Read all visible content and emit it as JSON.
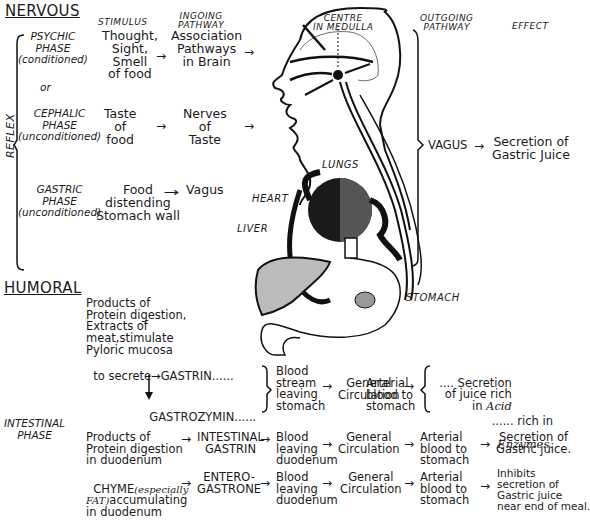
{
  "nervous": {
    "section_title": "NERVOUS",
    "reflex_label": "REFLEX",
    "headers": {
      "stimulus": "STIMULUS",
      "ingoing": "INGOING\nPATHWAY",
      "centre": "CENTRE\nIN MEDULLA",
      "outgoing": "OUTGOING\nPATHWAY",
      "effect": "EFFECT"
    },
    "phases": [
      {
        "name": "PSYCHIC\nPHASE\n(conditioned)",
        "stimulus": "Thought,\nSight,\nSmell\nof food",
        "pathway": "Association\nPathways\nin Brain"
      },
      {
        "name": "CEPHALIC\nPHASE\n(unconditioned)",
        "stimulus": "Taste\nof\nfood",
        "pathway": "Nerves\nof\nTaste"
      },
      {
        "name": "GASTRIC\nPHASE\n(unconditioned)",
        "stimulus": "Food\ndistending\nStomach wall",
        "pathway": "Vagus"
      }
    ],
    "or_label": "or",
    "outgoing_pathway": "VAGUS",
    "effect": "Secretion of\nGastric Juice"
  },
  "anatomy_labels": {
    "lungs": "LUNGS",
    "heart": "HEART",
    "liver": "LIVER",
    "stomach": "STOMACH"
  },
  "humoral": {
    "section_title": "HUMORAL",
    "stimulus_text": "Products of\nProtein digestion,\nExtracts of\nmeat,stimulate\nPyloric mucosa",
    "secrete_text": "to secrete",
    "gastrin": "GASTRIN",
    "gastrozymin": "GASTROZYMIN",
    "dots": "......",
    "bloodstream": "Blood\nstream\nleaving\nstomach",
    "general_circulation": "General\nCirculation",
    "arterial": "Arterial\nblood to\nstomach",
    "effect_acid_prefix": ".... Secretion\nof juice rich\nin ",
    "effect_acid_word": "Acid",
    "effect_enzymes_prefix": "...... rich in",
    "effect_enzymes_word": "Enzymes."
  },
  "intestinal": {
    "phase_label": "INTESTINAL\nPHASE",
    "rows": [
      {
        "stimulus": "Products of\nProtein digestion\nin duodenum",
        "hormone": "INTESTINAL\nGASTRIN",
        "blood": "Blood\nleaving\nduodenum",
        "circulation": "General\nCirculation",
        "arterial": "Arterial\nblood to\nstomach",
        "effect": "Secretion of\nGastric juice."
      },
      {
        "stimulus_prefix": "CHYME",
        "stimulus_italic1": "(especially",
        "stimulus_italic2": "FAT)",
        "stimulus_rest": "accumulating",
        "stimulus_line3": "in duodenum",
        "hormone": "ENTERO-\nGASTRONE",
        "blood": "Blood\nleaving\nduodenum",
        "circulation": "General\nCirculation",
        "arterial": "Arterial\nblood to\nstomach",
        "effect": "Inhibits\nsecretion of\nGastric juice\nnear end of meal."
      }
    ]
  },
  "arrow_glyph": "→",
  "down_arrow_glyph": "↓"
}
